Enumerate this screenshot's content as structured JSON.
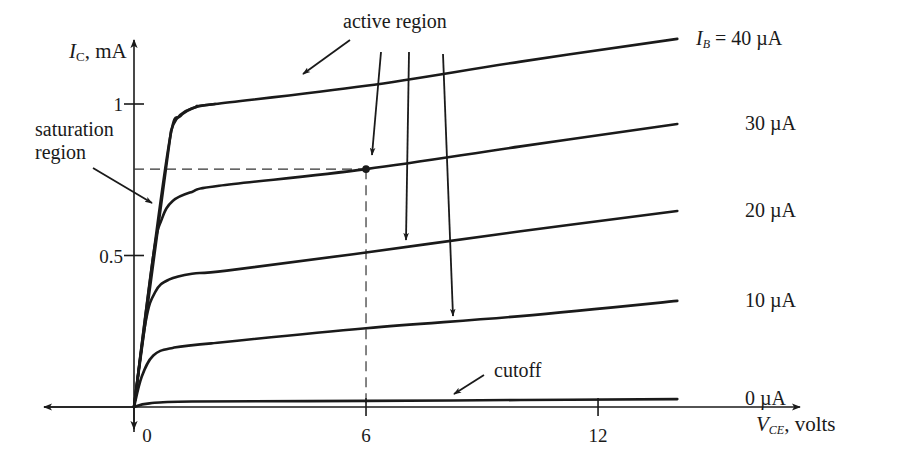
{
  "chart_data": {
    "type": "line",
    "title": "",
    "xlabel": "V_CE, volts",
    "ylabel": "I_C, mA",
    "xlabel_parts": {
      "main": "V",
      "sub": "CE",
      "rest": ", volts"
    },
    "ylabel_parts": {
      "main": "I",
      "sub": "C",
      "rest": ", mA"
    },
    "xlim": [
      -2.4,
      17.3
    ],
    "ylim": [
      0,
      1.22
    ],
    "x_ticks": [
      {
        "value": 0,
        "label": "0"
      },
      {
        "value": 6,
        "label": "6"
      },
      {
        "value": 12,
        "label": "12"
      }
    ],
    "y_ticks": [
      {
        "value": 0.5,
        "label": "0.5"
      },
      {
        "value": 1,
        "label": "1"
      }
    ],
    "grid": false,
    "legend": "inline curve labels at right end",
    "series": [
      {
        "name": "I_B = 40 µA",
        "label": "I_B = 40 µA",
        "label_parts": {
          "main": "I",
          "sub": "B",
          "rest": " = 40  µA"
        },
        "points": [
          [
            0,
            0
          ],
          [
            0.5,
            0.5
          ],
          [
            0.95,
            0.9
          ],
          [
            1.2,
            0.96
          ],
          [
            1.6,
            0.99
          ],
          [
            2.1,
            1.0
          ],
          [
            6,
            1.06
          ],
          [
            10,
            1.14
          ],
          [
            14.05,
            1.215
          ]
        ]
      },
      {
        "name": "30 µA",
        "label": "30 µA",
        "points": [
          [
            0,
            0
          ],
          [
            0.5,
            0.5
          ],
          [
            0.72,
            0.62
          ],
          [
            1.0,
            0.68
          ],
          [
            1.5,
            0.71
          ],
          [
            2.2,
            0.73
          ],
          [
            6,
            0.785
          ],
          [
            10,
            0.86
          ],
          [
            14.05,
            0.934
          ]
        ]
      },
      {
        "name": "20 µA",
        "label": "20 µA",
        "points": [
          [
            0,
            0
          ],
          [
            0.3,
            0.28
          ],
          [
            0.55,
            0.38
          ],
          [
            0.9,
            0.42
          ],
          [
            1.5,
            0.44
          ],
          [
            2.4,
            0.45
          ],
          [
            6,
            0.51
          ],
          [
            10,
            0.58
          ],
          [
            14.05,
            0.647
          ]
        ]
      },
      {
        "name": "10 µA",
        "label": "10 µA",
        "points": [
          [
            0,
            0
          ],
          [
            0.2,
            0.1
          ],
          [
            0.5,
            0.17
          ],
          [
            1.0,
            0.195
          ],
          [
            2.0,
            0.21
          ],
          [
            6,
            0.26
          ],
          [
            10,
            0.3
          ],
          [
            14.05,
            0.35
          ]
        ]
      },
      {
        "name": "0 µA",
        "label": "0 µA",
        "points": [
          [
            0,
            0
          ],
          [
            0.4,
            0.012
          ],
          [
            1.5,
            0.018
          ],
          [
            6,
            0.02
          ],
          [
            10,
            0.023
          ],
          [
            14.05,
            0.026
          ]
        ]
      }
    ],
    "annotations": {
      "active_region": "active region",
      "saturation_region": [
        "saturation",
        "region"
      ],
      "cutoff": "cutoff",
      "q_point": {
        "x": 6,
        "y": 0.785
      }
    }
  },
  "colors": {
    "ink": "#1a1a1a",
    "background": "#ffffff"
  }
}
